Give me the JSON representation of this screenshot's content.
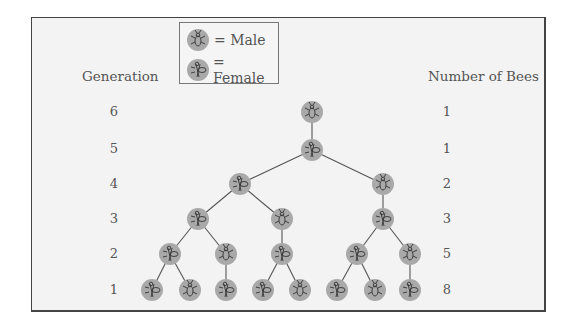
{
  "legend": {
    "male_label": "= Male",
    "female_label": "= Female"
  },
  "headers": {
    "generation": "Generation",
    "number_of_bees": "Number of Bees"
  },
  "rows": [
    {
      "generation": "6",
      "count": "1"
    },
    {
      "generation": "5",
      "count": "1"
    },
    {
      "generation": "4",
      "count": "2"
    },
    {
      "generation": "3",
      "count": "3"
    },
    {
      "generation": "2",
      "count": "5"
    },
    {
      "generation": "1",
      "count": "8"
    }
  ],
  "colors": {
    "node_fill": "#a9a9a9",
    "edge": "#555555",
    "frame_bg": "#f3f3f3"
  },
  "tree": {
    "nodes": [
      {
        "id": "g6",
        "gen": 6,
        "sex": "male",
        "x": 312,
        "y": 112
      },
      {
        "id": "g5",
        "gen": 5,
        "sex": "female",
        "x": 312,
        "y": 150
      },
      {
        "id": "g4a",
        "gen": 4,
        "sex": "female",
        "x": 240,
        "y": 184
      },
      {
        "id": "g4b",
        "gen": 4,
        "sex": "male",
        "x": 383,
        "y": 184
      },
      {
        "id": "g3a",
        "gen": 3,
        "sex": "female",
        "x": 198,
        "y": 219
      },
      {
        "id": "g3b",
        "gen": 3,
        "sex": "male",
        "x": 282,
        "y": 219
      },
      {
        "id": "g3c",
        "gen": 3,
        "sex": "female",
        "x": 383,
        "y": 219
      },
      {
        "id": "g2a",
        "gen": 2,
        "sex": "female",
        "x": 170,
        "y": 254
      },
      {
        "id": "g2b",
        "gen": 2,
        "sex": "male",
        "x": 226,
        "y": 254
      },
      {
        "id": "g2c",
        "gen": 2,
        "sex": "female",
        "x": 282,
        "y": 254
      },
      {
        "id": "g2d",
        "gen": 2,
        "sex": "female",
        "x": 357,
        "y": 254
      },
      {
        "id": "g2e",
        "gen": 2,
        "sex": "male",
        "x": 410,
        "y": 254
      },
      {
        "id": "g1a",
        "gen": 1,
        "sex": "female",
        "x": 152,
        "y": 290
      },
      {
        "id": "g1b",
        "gen": 1,
        "sex": "male",
        "x": 190,
        "y": 290
      },
      {
        "id": "g1c",
        "gen": 1,
        "sex": "female",
        "x": 226,
        "y": 290
      },
      {
        "id": "g1d",
        "gen": 1,
        "sex": "female",
        "x": 263,
        "y": 290
      },
      {
        "id": "g1e",
        "gen": 1,
        "sex": "male",
        "x": 300,
        "y": 290
      },
      {
        "id": "g1f",
        "gen": 1,
        "sex": "female",
        "x": 337,
        "y": 290
      },
      {
        "id": "g1g",
        "gen": 1,
        "sex": "male",
        "x": 375,
        "y": 290
      },
      {
        "id": "g1h",
        "gen": 1,
        "sex": "female",
        "x": 410,
        "y": 290
      }
    ],
    "edges": [
      [
        "g6",
        "g5"
      ],
      [
        "g5",
        "g4a"
      ],
      [
        "g5",
        "g4b"
      ],
      [
        "g4a",
        "g3a"
      ],
      [
        "g4a",
        "g3b"
      ],
      [
        "g4b",
        "g3c"
      ],
      [
        "g3a",
        "g2a"
      ],
      [
        "g3a",
        "g2b"
      ],
      [
        "g3b",
        "g2c"
      ],
      [
        "g3c",
        "g2d"
      ],
      [
        "g3c",
        "g2e"
      ],
      [
        "g2a",
        "g1a"
      ],
      [
        "g2a",
        "g1b"
      ],
      [
        "g2b",
        "g1c"
      ],
      [
        "g2c",
        "g1d"
      ],
      [
        "g2c",
        "g1e"
      ],
      [
        "g2d",
        "g1f"
      ],
      [
        "g2d",
        "g1g"
      ],
      [
        "g2e",
        "g1h"
      ]
    ]
  }
}
